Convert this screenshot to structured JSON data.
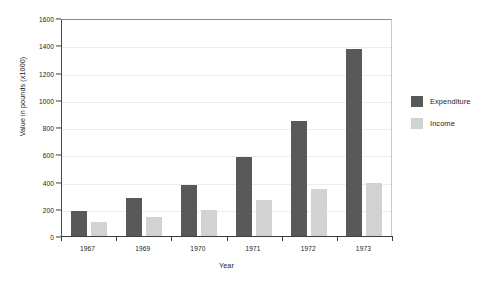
{
  "chart_data": {
    "type": "bar",
    "title": "",
    "xlabel": "Year",
    "ylabel": "Value in pounds (x1000)",
    "categories": [
      "1967",
      "1969",
      "1970",
      "1971",
      "1972",
      "1973"
    ],
    "series": [
      {
        "name": "Expenditure",
        "color": "#595959",
        "values": [
          190,
          290,
          380,
          585,
          855,
          1380
        ]
      },
      {
        "name": "Income",
        "color": "#d2d2d2",
        "values": [
          110,
          150,
          200,
          275,
          355,
          400
        ]
      }
    ],
    "ylim": [
      0,
      1600
    ],
    "ytick_step": 200,
    "yticks": [
      0,
      200,
      400,
      600,
      800,
      1000,
      1200,
      1400,
      1600
    ],
    "ytick_labels": [
      "0",
      "200",
      "400",
      "600",
      "800",
      "1000",
      "1200",
      "1400",
      "1600"
    ],
    "grid": true,
    "grid_axis": "y",
    "legend_position": "right",
    "background_color": "#ffffff",
    "axis_color": "#3d3d3d",
    "grid_color": "#ededed"
  }
}
